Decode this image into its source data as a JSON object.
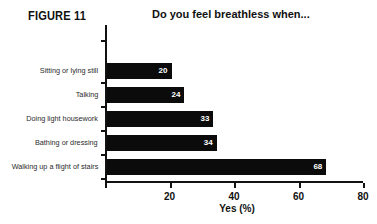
{
  "figure": {
    "tag": "FIGURE 11"
  },
  "chart_data": {
    "type": "bar",
    "orientation": "horizontal",
    "title": "Do you feel breathless when...",
    "xlabel": "Yes (%)",
    "ylabel": "",
    "categories": [
      "Sitting or lying still",
      "Talking",
      "Doing light housework",
      "Bathing or dressing",
      "Walking up a flight of stairs"
    ],
    "values": [
      20,
      24,
      33,
      34,
      68
    ],
    "value_labels": [
      "20",
      "24",
      "33",
      "34",
      "68"
    ],
    "xlim": [
      0,
      80
    ],
    "xticks": [
      0,
      20,
      40,
      60,
      80
    ],
    "xtick_labels": [
      "",
      "20",
      "40",
      "60",
      "80"
    ],
    "grid": false,
    "legend": false,
    "bar_color": "#0b0b0b",
    "value_label_color": "#ffffff"
  }
}
